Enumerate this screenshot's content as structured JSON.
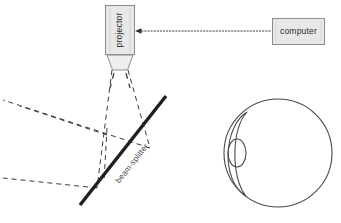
{
  "diagram": {
    "background_color": "#ffffff",
    "stroke_color": "#3a3a3a",
    "box_fill": "#e8e8e8",
    "box_stroke": "#8c8c8c",
    "beam_splitter_color": "#1f1f1f",
    "ray_color": "#3a3a3a",
    "nodes": {
      "projector": {
        "label": "projector",
        "orientation": "vertical",
        "x": 105,
        "y": 5,
        "width": 30,
        "height": 50
      },
      "computer": {
        "label": "computer",
        "orientation": "horizontal",
        "x": 272,
        "y": 18,
        "width": 53,
        "height": 27
      },
      "beam_splitter": {
        "label": "beam-splitter",
        "x1": 80,
        "y1": 205,
        "x2": 166,
        "y2": 96,
        "rotation_deg": -51
      },
      "eye": {
        "label": "eye",
        "center_x": 278,
        "center_y": 153,
        "radius": 54,
        "lens_center_x": 237,
        "lens_center_y": 153,
        "lens_rx": 9,
        "lens_ry": 14
      }
    },
    "connections": [
      {
        "name": "computer-to-projector",
        "style": "dotted",
        "arrow": "left",
        "from": "computer",
        "to": "projector"
      },
      {
        "name": "projector-to-beamsplitter",
        "style": "dashed",
        "from": "projector",
        "to": "beam-splitter"
      },
      {
        "name": "beamsplitter-reflected-rays",
        "style": "dashed",
        "from": "beam-splitter",
        "to": "left-field"
      }
    ]
  }
}
